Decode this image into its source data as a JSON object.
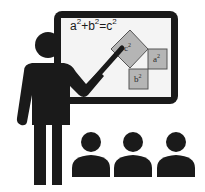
{
  "illustration": {
    "subject": "teacher presenting at whiteboard to audience",
    "formula": {
      "a": "a",
      "a_exp": "2",
      "plus": "+",
      "b": "b",
      "b_exp": "2",
      "equals": "=",
      "c": "c",
      "c_exp": "2"
    },
    "squares": [
      {
        "label": "c",
        "exp": "2"
      },
      {
        "label": "a",
        "exp": "2"
      },
      {
        "label": "b",
        "exp": "2"
      }
    ],
    "audience_count": 3
  },
  "colors": {
    "ink": "#1a1a1a",
    "board_surface": "#f4f4f4",
    "square_fill": "#b5b5b5",
    "square_stroke": "#555555",
    "background": "#ffffff"
  }
}
